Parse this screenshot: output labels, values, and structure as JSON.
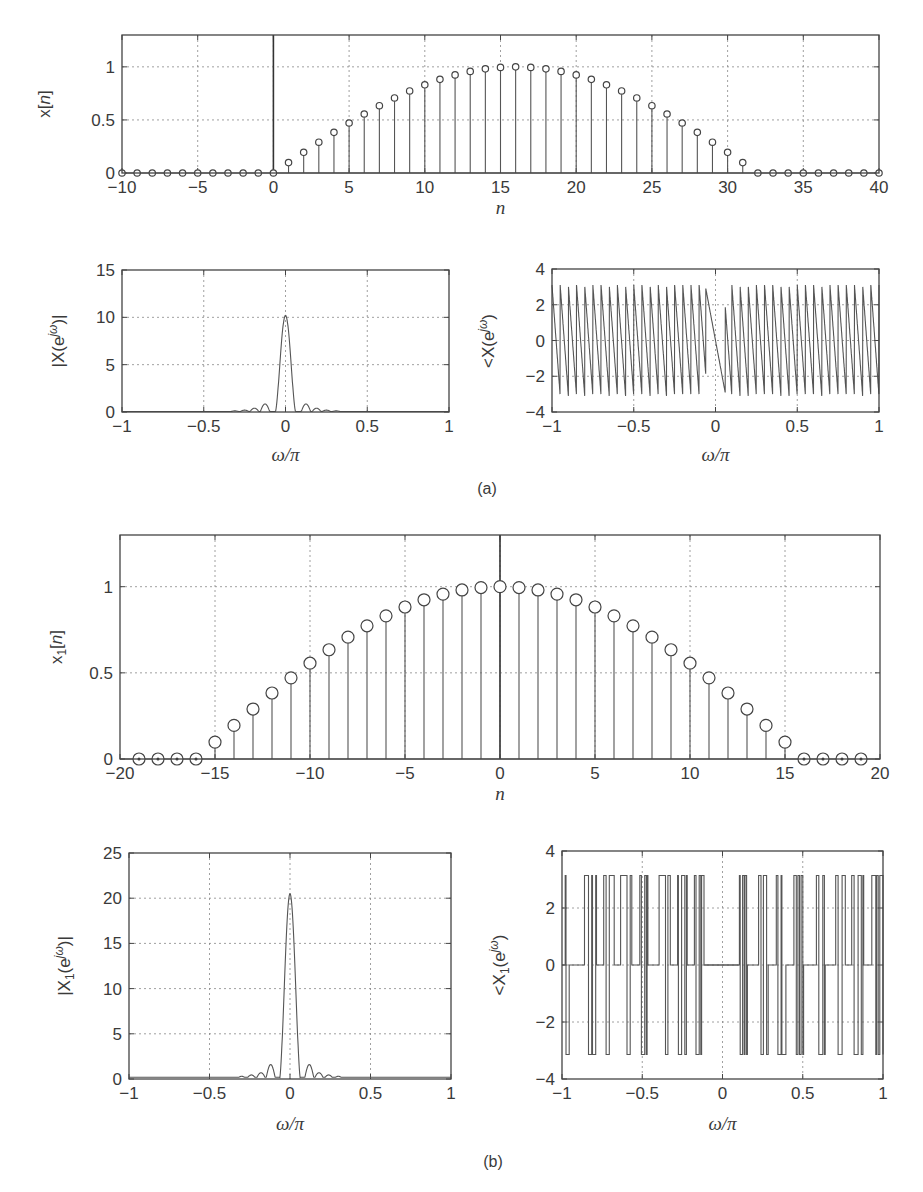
{
  "figure": {
    "captions": {
      "a": "(a)",
      "b": "(b)"
    }
  },
  "chart_data": [
    {
      "id": "a_time",
      "type": "stem",
      "panel": "(a)",
      "title": "",
      "xlabel": "n",
      "ylabel": "x[n]",
      "xlim": [
        -10,
        40
      ],
      "ylim": [
        0,
        1.3
      ],
      "xticks": [
        -10,
        -5,
        0,
        5,
        10,
        15,
        20,
        25,
        30,
        35,
        40
      ],
      "yticks": [
        0,
        0.5,
        1
      ],
      "ytick_labels": [
        "0",
        "0.5",
        "1"
      ],
      "grid": true,
      "n": [
        -10,
        -9,
        -8,
        -7,
        -6,
        -5,
        -4,
        -3,
        -2,
        -1,
        0,
        1,
        2,
        3,
        4,
        5,
        6,
        7,
        8,
        9,
        10,
        11,
        12,
        13,
        14,
        15,
        16,
        17,
        18,
        19,
        20,
        21,
        22,
        23,
        24,
        25,
        26,
        27,
        28,
        29,
        30,
        31,
        32,
        33,
        34,
        35,
        36,
        37,
        38,
        39,
        40
      ],
      "values": [
        0,
        0,
        0,
        0,
        0,
        0,
        0,
        0,
        0,
        0,
        0,
        0.098,
        0.195,
        0.29,
        0.383,
        0.471,
        0.556,
        0.634,
        0.707,
        0.773,
        0.831,
        0.882,
        0.924,
        0.957,
        0.981,
        0.995,
        1.0,
        0.995,
        0.981,
        0.957,
        0.924,
        0.882,
        0.831,
        0.773,
        0.707,
        0.634,
        0.556,
        0.471,
        0.383,
        0.29,
        0.195,
        0.098,
        0,
        0,
        0,
        0,
        0,
        0,
        0,
        0,
        0
      ],
      "marker_size": "small"
    },
    {
      "id": "a_mag",
      "type": "line",
      "panel": "(a)",
      "xlabel": "ω/π",
      "ylabel": "|X(e^{jω})|",
      "xlim": [
        -1,
        1
      ],
      "ylim": [
        0,
        15
      ],
      "xticks": [
        -1,
        -0.5,
        0,
        0.5,
        1
      ],
      "xtick_labels": [
        "−1",
        "−0.5",
        "0",
        "0.5",
        "1"
      ],
      "yticks": [
        0,
        5,
        10,
        15
      ],
      "ytick_labels": [
        "0",
        "5",
        "10",
        "15"
      ],
      "grid": true,
      "peak": {
        "x": 0,
        "y": 10.2
      },
      "mainlobe_halfwidth": 0.0625,
      "sidelobes": [
        {
          "x": -0.125,
          "y": 0.85
        },
        {
          "x": 0.125,
          "y": 0.85
        },
        {
          "x": -0.19,
          "y": 0.4
        },
        {
          "x": 0.19,
          "y": 0.4
        },
        {
          "x": -0.25,
          "y": 0.2
        },
        {
          "x": 0.25,
          "y": 0.2
        },
        {
          "x": -0.31,
          "y": 0.12
        },
        {
          "x": 0.31,
          "y": 0.12
        }
      ]
    },
    {
      "id": "a_phase",
      "type": "line",
      "panel": "(a)",
      "xlabel": "ω/π",
      "ylabel": "<X(e^{jω})",
      "xlim": [
        -1,
        1
      ],
      "ylim": [
        -4,
        4
      ],
      "xticks": [
        -1,
        -0.5,
        0,
        0.5,
        1
      ],
      "xtick_labels": [
        "−1",
        "−0.5",
        "0",
        "0.5",
        "1"
      ],
      "yticks": [
        -4,
        -2,
        0,
        2,
        4
      ],
      "ytick_labels": [
        "−4",
        "−2",
        "0",
        "2",
        "4"
      ],
      "grid": true,
      "pattern": "sawtooth (wrapped linear phase, ~40 cycles, range ≈ ±3.1)",
      "cycles": 40,
      "amplitude": 3.1
    },
    {
      "id": "b_time",
      "type": "stem",
      "panel": "(b)",
      "xlabel": "n",
      "ylabel": "x_1[n]",
      "xlim": [
        -20,
        20
      ],
      "ylim": [
        0,
        1.3
      ],
      "xticks": [
        -20,
        -15,
        -10,
        -5,
        0,
        5,
        10,
        15,
        20
      ],
      "xtick_labels": [
        "−20",
        "−15",
        "−10",
        "−5",
        "0",
        "5",
        "10",
        "15",
        "20"
      ],
      "yticks": [
        0,
        0.5,
        1
      ],
      "ytick_labels": [
        "0",
        "0.5",
        "1"
      ],
      "grid": true,
      "n": [
        -19,
        -18,
        -17,
        -16,
        -15,
        -14,
        -13,
        -12,
        -11,
        -10,
        -9,
        -8,
        -7,
        -6,
        -5,
        -4,
        -3,
        -2,
        -1,
        0,
        1,
        2,
        3,
        4,
        5,
        6,
        7,
        8,
        9,
        10,
        11,
        12,
        13,
        14,
        15,
        16,
        17,
        18,
        19
      ],
      "values": [
        0,
        0,
        0,
        0,
        0.098,
        0.195,
        0.29,
        0.383,
        0.471,
        0.556,
        0.634,
        0.707,
        0.773,
        0.831,
        0.882,
        0.924,
        0.957,
        0.981,
        0.995,
        1.0,
        0.995,
        0.981,
        0.957,
        0.924,
        0.882,
        0.831,
        0.773,
        0.707,
        0.634,
        0.556,
        0.471,
        0.383,
        0.29,
        0.195,
        0.098,
        0,
        0,
        0,
        0
      ],
      "marker_size": "large"
    },
    {
      "id": "b_mag",
      "type": "line",
      "panel": "(b)",
      "xlabel": "ω/π",
      "ylabel": "|X_1(e^{jω})|",
      "xlim": [
        -1,
        1
      ],
      "ylim": [
        0,
        25
      ],
      "xticks": [
        -1,
        -0.5,
        0,
        0.5,
        1
      ],
      "xtick_labels": [
        "−1",
        "−0.5",
        "0",
        "0.5",
        "1"
      ],
      "yticks": [
        0,
        5,
        10,
        15,
        20,
        25
      ],
      "ytick_labels": [
        "0",
        "5",
        "10",
        "15",
        "20",
        "25"
      ],
      "grid": true,
      "peak": {
        "x": 0,
        "y": 20.5
      },
      "mainlobe_halfwidth": 0.0645,
      "sidelobes": [
        {
          "x": -0.12,
          "y": 1.6
        },
        {
          "x": 0.12,
          "y": 1.6
        },
        {
          "x": -0.18,
          "y": 0.7
        },
        {
          "x": 0.18,
          "y": 0.7
        },
        {
          "x": -0.24,
          "y": 0.45
        },
        {
          "x": 0.24,
          "y": 0.45
        },
        {
          "x": -0.3,
          "y": 0.3
        },
        {
          "x": 0.3,
          "y": 0.3
        }
      ],
      "floor": 0.2
    },
    {
      "id": "b_phase",
      "type": "line",
      "panel": "(b)",
      "xlabel": "ω/π",
      "ylabel": "<X_1(e^{jω})",
      "xlim": [
        -1,
        1
      ],
      "ylim": [
        -4,
        4
      ],
      "xticks": [
        -1,
        -0.5,
        0,
        0.5,
        1
      ],
      "xtick_labels": [
        "−1",
        "−0.5",
        "0",
        "0.5",
        "1"
      ],
      "yticks": [
        -4,
        -2,
        0,
        2,
        4
      ],
      "ytick_labels": [
        "−4",
        "−2",
        "0",
        "2",
        "4"
      ],
      "grid": true,
      "pattern": "jumps between +π, 0 and −π (values ≈ ±3.14 and 0)",
      "levels": [
        3.14,
        0,
        -3.14
      ],
      "segments": [
        [
          -1.0,
          0
        ],
        [
          -0.98,
          3.14
        ],
        [
          -0.975,
          -3.14
        ],
        [
          -0.96,
          -3.14
        ],
        [
          -0.955,
          0
        ],
        [
          -0.87,
          0
        ],
        [
          -0.86,
          3.14
        ],
        [
          -0.84,
          3.14
        ],
        [
          -0.835,
          -3.14
        ],
        [
          -0.82,
          -3.14
        ],
        [
          -0.815,
          3.14
        ],
        [
          -0.81,
          -3.14
        ],
        [
          -0.8,
          -3.14
        ],
        [
          -0.79,
          3.14
        ],
        [
          -0.785,
          0
        ],
        [
          -0.745,
          0
        ],
        [
          -0.74,
          3.14
        ],
        [
          -0.73,
          3.14
        ],
        [
          -0.725,
          -3.14
        ],
        [
          -0.71,
          -3.14
        ],
        [
          -0.705,
          3.14
        ],
        [
          -0.68,
          3.14
        ],
        [
          -0.675,
          0
        ],
        [
          -0.64,
          0
        ],
        [
          -0.635,
          3.14
        ],
        [
          -0.6,
          3.14
        ],
        [
          -0.595,
          -3.14
        ],
        [
          -0.58,
          -3.14
        ],
        [
          -0.575,
          3.14
        ],
        [
          -0.57,
          3.14
        ],
        [
          -0.565,
          0
        ],
        [
          -0.52,
          0
        ],
        [
          -0.515,
          3.14
        ],
        [
          -0.505,
          -3.14
        ],
        [
          -0.49,
          -3.14
        ],
        [
          -0.485,
          3.14
        ],
        [
          -0.475,
          -3.14
        ],
        [
          -0.47,
          3.14
        ],
        [
          -0.465,
          0
        ],
        [
          -0.4,
          0
        ],
        [
          -0.395,
          3.14
        ],
        [
          -0.36,
          3.14
        ],
        [
          -0.355,
          -3.14
        ],
        [
          -0.345,
          -3.14
        ],
        [
          -0.34,
          3.14
        ],
        [
          -0.33,
          3.14
        ],
        [
          -0.325,
          0
        ],
        [
          -0.285,
          0
        ],
        [
          -0.28,
          3.14
        ],
        [
          -0.275,
          -3.14
        ],
        [
          -0.26,
          -3.14
        ],
        [
          -0.255,
          3.14
        ],
        [
          -0.24,
          3.14
        ],
        [
          -0.235,
          -3.14
        ],
        [
          -0.225,
          3.14
        ],
        [
          -0.22,
          0
        ],
        [
          -0.18,
          0
        ],
        [
          -0.175,
          3.14
        ],
        [
          -0.165,
          -3.14
        ],
        [
          -0.15,
          -3.14
        ],
        [
          -0.145,
          3.14
        ],
        [
          -0.135,
          -3.14
        ],
        [
          -0.13,
          3.14
        ],
        [
          -0.12,
          3.14
        ],
        [
          -0.115,
          0
        ],
        [
          0.1,
          0
        ],
        [
          0.105,
          3.14
        ],
        [
          0.11,
          -3.14
        ],
        [
          0.12,
          -3.14
        ],
        [
          0.125,
          3.14
        ],
        [
          0.135,
          -3.14
        ],
        [
          0.14,
          3.14
        ],
        [
          0.15,
          -3.14
        ],
        [
          0.155,
          0
        ],
        [
          0.22,
          0
        ],
        [
          0.225,
          3.14
        ],
        [
          0.24,
          -3.14
        ],
        [
          0.255,
          3.14
        ],
        [
          0.27,
          3.14
        ],
        [
          0.275,
          -3.14
        ],
        [
          0.285,
          0
        ],
        [
          0.33,
          0
        ],
        [
          0.335,
          3.14
        ],
        [
          0.345,
          -3.14
        ],
        [
          0.36,
          -3.14
        ],
        [
          0.365,
          3.14
        ],
        [
          0.37,
          -3.14
        ],
        [
          0.39,
          -3.14
        ],
        [
          0.395,
          0
        ],
        [
          0.44,
          0
        ],
        [
          0.445,
          3.14
        ],
        [
          0.46,
          -3.14
        ],
        [
          0.47,
          3.14
        ],
        [
          0.48,
          -3.14
        ],
        [
          0.49,
          3.14
        ],
        [
          0.5,
          -3.14
        ],
        [
          0.505,
          0
        ],
        [
          0.58,
          0
        ],
        [
          0.585,
          3.14
        ],
        [
          0.6,
          -3.14
        ],
        [
          0.62,
          -3.14
        ],
        [
          0.625,
          3.14
        ],
        [
          0.635,
          -3.14
        ],
        [
          0.64,
          0
        ],
        [
          0.7,
          0
        ],
        [
          0.705,
          3.14
        ],
        [
          0.72,
          -3.14
        ],
        [
          0.74,
          -3.14
        ],
        [
          0.745,
          3.14
        ],
        [
          0.76,
          3.14
        ],
        [
          0.765,
          0
        ],
        [
          0.8,
          0
        ],
        [
          0.805,
          3.14
        ],
        [
          0.82,
          -3.14
        ],
        [
          0.84,
          -3.14
        ],
        [
          0.845,
          3.14
        ],
        [
          0.86,
          3.14
        ],
        [
          0.865,
          -3.14
        ],
        [
          0.875,
          3.14
        ],
        [
          0.88,
          0
        ],
        [
          0.92,
          0
        ],
        [
          0.93,
          3.14
        ],
        [
          0.95,
          3.14
        ],
        [
          0.955,
          -3.14
        ],
        [
          0.96,
          3.14
        ],
        [
          0.97,
          -3.14
        ],
        [
          0.98,
          3.14
        ],
        [
          0.99,
          3.14
        ],
        [
          1.0,
          -3.14
        ]
      ]
    }
  ]
}
